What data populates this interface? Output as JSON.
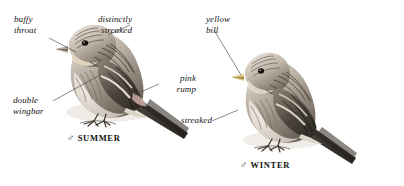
{
  "plate": {
    "title": "Twite male summer and winter plumage plate",
    "background_color": "#ffffff",
    "ink_color": "#1a1a1a",
    "leader_line_color": "#3a3a3a"
  },
  "labels": [
    {
      "id": "buffy-throat",
      "text": "buffy\nthroat",
      "align": "left",
      "x": 14,
      "y": 14,
      "target": "summer bird throat"
    },
    {
      "id": "distinctly-streaked",
      "text": "distinctly\nstreaked",
      "align": "right",
      "x": 132,
      "y": 14,
      "target": "summer bird mantle"
    },
    {
      "id": "yellow-bill",
      "text": "yellow\nbill",
      "align": "left",
      "x": 206,
      "y": 14,
      "target": "winter bird bill"
    },
    {
      "id": "pink-rump",
      "text": "pink\nrump",
      "align": "right",
      "x": 160,
      "y": 73,
      "target": "summer bird rump"
    },
    {
      "id": "double-wingbar",
      "text": "double\nwingbar",
      "align": "left",
      "x": 13,
      "y": 95,
      "target": "summer bird wing"
    },
    {
      "id": "streaked",
      "text": "streaked",
      "align": "right",
      "x": 176,
      "y": 115,
      "target": "winter bird flank"
    }
  ],
  "captions": [
    {
      "id": "summer",
      "sex_symbol": "♂",
      "text": "SUMMER",
      "x": 67,
      "y": 133
    },
    {
      "id": "winter",
      "sex_symbol": "♂",
      "text": "WINTER",
      "x": 240,
      "y": 160
    }
  ],
  "figures": [
    {
      "id": "summer-bird",
      "plumage": "male summer",
      "pose": "perched, facing left"
    },
    {
      "id": "winter-bird",
      "plumage": "male winter",
      "pose": "perched, facing left"
    }
  ]
}
